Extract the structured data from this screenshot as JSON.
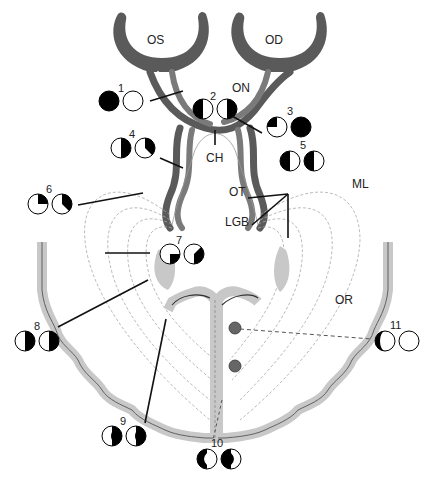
{
  "structures": {
    "left_eye": "OS",
    "right_eye": "OD",
    "optic_nerve": "ON",
    "chiasm": "CH",
    "optic_tract": "OT",
    "lateral_geniculate_body": "LGB",
    "meyers_loop": "ML",
    "optic_radiation": "OR"
  },
  "lesions": [
    {
      "id": "1",
      "label": "1",
      "left_field": "complete-loss",
      "right_field": "normal"
    },
    {
      "id": "2",
      "label": "2",
      "left_field": "temporal-hemianopia",
      "right_field": "temporal-hemianopia"
    },
    {
      "id": "3",
      "label": "3",
      "left_field": "upper-temporal-quadrant-loss",
      "right_field": "complete-loss"
    },
    {
      "id": "4",
      "label": "4",
      "left_field": "right-hemianopia",
      "right_field": "right-hemianopia-incongruous"
    },
    {
      "id": "5",
      "label": "5",
      "left_field": "left-hemianopia",
      "right_field": "left-hemianopia"
    },
    {
      "id": "6",
      "label": "6",
      "left_field": "upper-quadrant",
      "right_field": "upper-quadrant-incongruous"
    },
    {
      "id": "7",
      "label": "7",
      "left_field": "lower-quadrant",
      "right_field": "lower-quadrant-incongruous"
    },
    {
      "id": "8",
      "label": "8",
      "left_field": "right-hemianopia",
      "right_field": "right-hemianopia"
    },
    {
      "id": "9",
      "label": "9",
      "left_field": "macular-sparing-hemianopia",
      "right_field": "macular-sparing-hemianopia"
    },
    {
      "id": "10",
      "label": "10",
      "left_field": "central-hemianopic-scotoma",
      "right_field": "central-hemianopic-scotoma"
    },
    {
      "id": "11",
      "label": "11",
      "left_field": "temporal-crescent",
      "right_field": "normal"
    }
  ],
  "colors": {
    "nerve_dark": "#5a5a5a",
    "nerve_mid": "#7a7a7a",
    "cortex_gray": "#c8c8c8",
    "defect": "#000000",
    "lesion_dot": "#666666"
  }
}
